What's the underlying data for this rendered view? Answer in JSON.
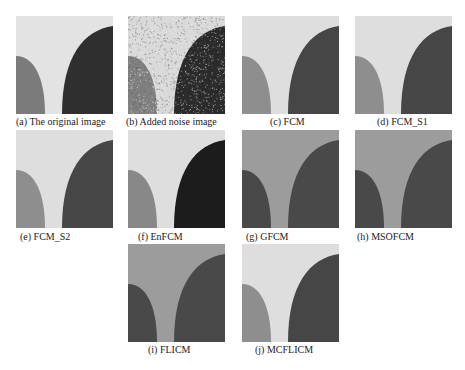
{
  "figure": {
    "panels": [
      {
        "id": "a",
        "caption": "(a) The original image",
        "x": 16,
        "y": 16,
        "cap_x": 16,
        "cap_y": 116,
        "bg": "#e3e3e3",
        "left": "#7b7b7b",
        "right": "#2f2f2f",
        "noise": false
      },
      {
        "id": "b",
        "caption": "(b) Added noise image",
        "x": 128,
        "y": 16,
        "cap_x": 126,
        "cap_y": 116,
        "bg": "#d9d9d9",
        "left": "#808080",
        "right": "#2a2a2a",
        "noise": true
      },
      {
        "id": "c",
        "caption": "(c) FCM",
        "x": 242,
        "y": 16,
        "cap_x": 270,
        "cap_y": 116,
        "bg": "#dedede",
        "left": "#8e8e8e",
        "right": "#464646",
        "noise": false
      },
      {
        "id": "d",
        "caption": "(d) FCM_S1",
        "x": 355,
        "y": 16,
        "cap_x": 377,
        "cap_y": 116,
        "bg": "#dedede",
        "left": "#8e8e8e",
        "right": "#464646",
        "noise": false
      },
      {
        "id": "e",
        "caption": "(e) FCM_S2",
        "x": 16,
        "y": 130,
        "cap_x": 20,
        "cap_y": 231,
        "bg": "#dedede",
        "left": "#8e8e8e",
        "right": "#464646",
        "noise": false
      },
      {
        "id": "f",
        "caption": "(f) EnFCM",
        "x": 128,
        "y": 130,
        "cap_x": 138,
        "cap_y": 231,
        "bg": "#dedede",
        "left": "#888888",
        "right": "#1c1c1c",
        "noise": false
      },
      {
        "id": "g",
        "caption": "(g) GFCM",
        "x": 242,
        "y": 130,
        "cap_x": 246,
        "cap_y": 231,
        "bg": "#9c9c9c",
        "left": "#494949",
        "right": "#494949",
        "noise": false
      },
      {
        "id": "h",
        "caption": "(h) MSOFCM",
        "x": 355,
        "y": 130,
        "cap_x": 357,
        "cap_y": 231,
        "bg": "#9c9c9c",
        "left": "#494949",
        "right": "#494949",
        "noise": false
      },
      {
        "id": "i",
        "caption": "(i) FLICM",
        "x": 128,
        "y": 244,
        "cap_x": 148,
        "cap_y": 344,
        "bg": "#9c9c9c",
        "left": "#494949",
        "right": "#494949",
        "noise": false
      },
      {
        "id": "j",
        "caption": "(j) MCFLICM",
        "x": 242,
        "y": 244,
        "cap_x": 255,
        "cap_y": 344,
        "bg": "#dedede",
        "left": "#8e8e8e",
        "right": "#464646",
        "noise": false
      }
    ]
  }
}
